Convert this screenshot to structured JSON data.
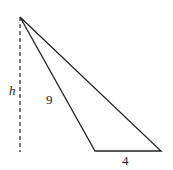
{
  "diagram": {
    "type": "triangle-with-height",
    "labels": {
      "height": "h",
      "side_slanted": "9",
      "base": "4"
    },
    "colors": {
      "stroke": "#222222",
      "background": "#ffffff"
    }
  }
}
